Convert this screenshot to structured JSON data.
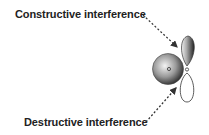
{
  "labels": {
    "constructive": "Constructive interference",
    "destructive": "Destructive interference"
  },
  "colors": {
    "text": "#222222",
    "sphere_dark": "#333333",
    "sphere_light": "#f0f0f0",
    "outline": "#333333"
  }
}
